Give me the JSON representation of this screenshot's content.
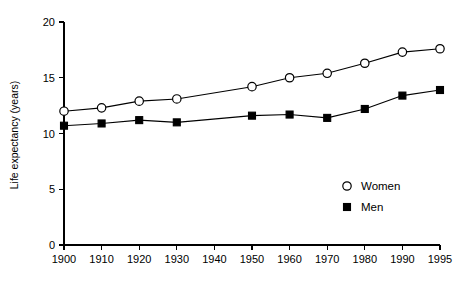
{
  "chart_data": {
    "type": "line",
    "title": "",
    "subtitle": "",
    "xlabel": "",
    "ylabel": "Life expectancy (years)",
    "x": [
      1900,
      1910,
      1920,
      1930,
      1940,
      1950,
      1960,
      1970,
      1980,
      1990,
      1995
    ],
    "xtick_labels": [
      "1900",
      "1910",
      "1920",
      "1930",
      "1940",
      "1950",
      "1960",
      "1970",
      "1980",
      "1990",
      "1995"
    ],
    "ytick_labels": [
      "0",
      "5",
      "10",
      "15",
      "20"
    ],
    "ytick_values": [
      0,
      5,
      10,
      15,
      20
    ],
    "xlim": [
      1900,
      1995
    ],
    "ylim": [
      0,
      20
    ],
    "grid": false,
    "legend_position": "inside-lower-right",
    "series": [
      {
        "name": "Women",
        "marker": "open-circle",
        "color": "#000000",
        "x": [
          1900,
          1910,
          1920,
          1930,
          1950,
          1960,
          1970,
          1980,
          1990,
          1995
        ],
        "values": [
          12.0,
          12.3,
          12.9,
          13.1,
          14.2,
          15.0,
          15.4,
          16.3,
          17.3,
          17.6
        ]
      },
      {
        "name": "Men",
        "marker": "filled-square",
        "color": "#000000",
        "x": [
          1900,
          1910,
          1920,
          1930,
          1950,
          1960,
          1970,
          1980,
          1990,
          1995
        ],
        "values": [
          10.7,
          10.9,
          11.2,
          11.0,
          11.6,
          11.7,
          11.4,
          12.2,
          13.4,
          13.9
        ]
      }
    ]
  },
  "legend": {
    "entries": [
      {
        "label": "Women",
        "marker": "open-circle"
      },
      {
        "label": "Men",
        "marker": "filled-square"
      }
    ]
  },
  "colors": {
    "background": "#ffffff",
    "foreground": "#000000"
  }
}
